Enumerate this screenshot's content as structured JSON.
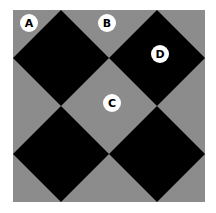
{
  "figure": {
    "colors": {
      "background": "#ffffff",
      "field": "#8c8c8c",
      "diamond": "#000000",
      "marker_fill": "#ffffff",
      "marker_text": "#000000"
    },
    "markers": [
      {
        "label": "A",
        "x": 29,
        "y": 23
      },
      {
        "label": "B",
        "x": 107,
        "y": 23
      },
      {
        "label": "C",
        "x": 112,
        "y": 103
      },
      {
        "label": "D",
        "x": 160,
        "y": 54
      }
    ]
  }
}
